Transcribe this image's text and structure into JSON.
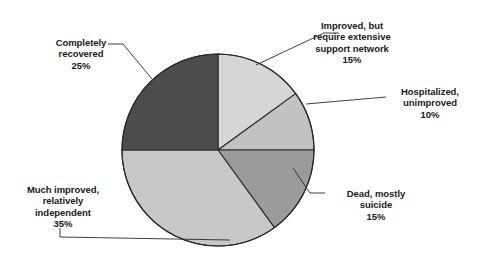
{
  "chart_data": {
    "type": "pie",
    "title": "",
    "subtitle": "",
    "xlabel": "",
    "ylabel": "",
    "legend": "none",
    "grid": false,
    "units": "percent",
    "total": 100,
    "categories": [
      "Improved, but require extensive support network",
      "Hospitalized, unimproved",
      "Dead, mostly suicide",
      "Much improved, relatively independent",
      "Completely recovered"
    ],
    "values": [
      15,
      10,
      15,
      35,
      25
    ],
    "slices": [
      {
        "label": "Improved, but\nrequire extensive\nsupport network",
        "label_flat": "Improved, but require extensive support network",
        "value": 15,
        "value_text": "15%",
        "color": "#d6d6d6",
        "start_angle": 0,
        "end_angle": 54
      },
      {
        "label": "Hospitalized,\nunimproved",
        "label_flat": "Hospitalized, unimproved",
        "value": 10,
        "value_text": "10%",
        "color": "#c2c2c2",
        "start_angle": 54,
        "end_angle": 90
      },
      {
        "label": "Dead, mostly\nsuicide",
        "label_flat": "Dead, mostly suicide",
        "value": 15,
        "value_text": "15%",
        "color": "#9b9b9b",
        "start_angle": 90,
        "end_angle": 144
      },
      {
        "label": "Much improved,\nrelatively\nindependent",
        "label_flat": "Much improved, relatively independent",
        "value": 35,
        "value_text": "35%",
        "color": "#c8c8c8",
        "start_angle": 144,
        "end_angle": 270
      },
      {
        "label": "Completely\nrecovered",
        "label_flat": "Completely recovered",
        "value": 25,
        "value_text": "25%",
        "color": "#4c4c4c",
        "start_angle": 270,
        "end_angle": 360
      }
    ],
    "geometry": {
      "center_x": 218,
      "center_y": 150,
      "radius": 96
    },
    "style": {
      "background": "#ffffff",
      "outline_color": "#2a2a2a",
      "leader_color": "#2a2a2a",
      "text_color": "#1a1a1a"
    }
  }
}
